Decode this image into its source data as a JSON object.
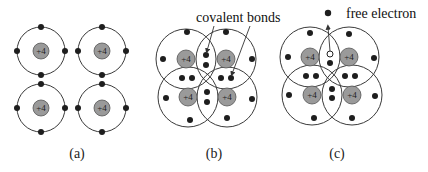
{
  "figure": {
    "panels": [
      {
        "id": "a",
        "caption": "(a)",
        "description": "Four isolated silicon atoms, each nucleus +4 with four valence electrons"
      },
      {
        "id": "b",
        "caption": "(b)",
        "description": "Atoms sharing electrons in covalent bonds",
        "annotation": "covalent bonds"
      },
      {
        "id": "c",
        "caption": "(c)",
        "description": "One bond broken, releasing a free electron and leaving a hole",
        "annotation": "free electron"
      }
    ],
    "nucleus_charge": "+4",
    "colors": {
      "nucleus_fill": "#9a9a9a",
      "electron": "#1e1e1e",
      "orbit": "#3a3a3a"
    }
  }
}
